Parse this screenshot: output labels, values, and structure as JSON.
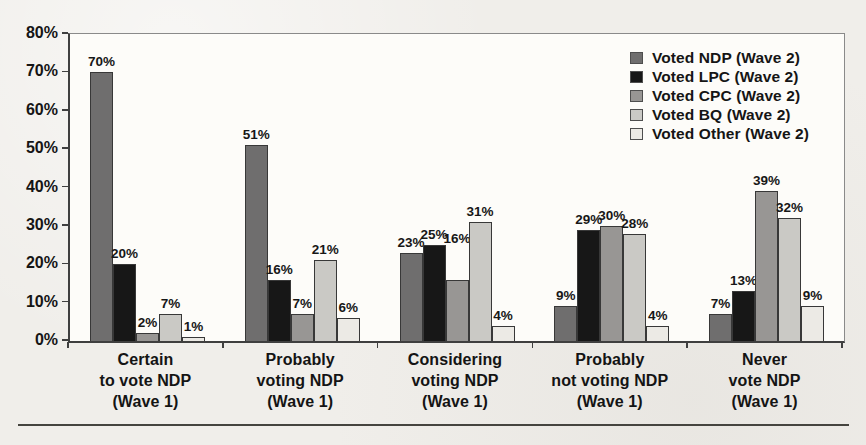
{
  "chart_data": {
    "type": "bar",
    "title": "",
    "categories": [
      "Certain\nto vote NDP\n(Wave 1)",
      "Probably\nvoting NDP\n(Wave 1)",
      "Considering\nvoting NDP\n(Wave 1)",
      "Probably\nnot voting NDP\n(Wave 1)",
      "Never\nvote NDP\n(Wave 1)"
    ],
    "series": [
      {
        "name": "Voted NDP (Wave 2)",
        "color": "#6f6e6e",
        "pattern": "solid",
        "values": [
          70,
          51,
          23,
          9,
          7
        ]
      },
      {
        "name": "Voted LPC (Wave 2)",
        "color": "#171717",
        "pattern": "solid",
        "values": [
          20,
          16,
          25,
          29,
          13
        ]
      },
      {
        "name": "Voted CPC (Wave 2)",
        "color": "#989694",
        "pattern": "fine-vertical",
        "values": [
          2,
          7,
          16,
          30,
          39
        ]
      },
      {
        "name": "Voted BQ (Wave 2)",
        "color": "#cac9c5",
        "pattern": "fine-grid",
        "values": [
          7,
          21,
          31,
          28,
          32
        ]
      },
      {
        "name": "Voted Other (Wave 2)",
        "color": "#eceae5",
        "pattern": "faint-grid",
        "values": [
          1,
          6,
          4,
          4,
          9
        ]
      }
    ],
    "value_label_suffix": "%",
    "ylim": [
      0,
      80
    ],
    "ytick_step": 10,
    "ytick_labels": [
      "0%",
      "10%",
      "20%",
      "30%",
      "40%",
      "50%",
      "60%",
      "70%",
      "80%"
    ],
    "grid": false,
    "legend_position": "top-right-inside",
    "label_raise_px": {
      "2,2": 31
    }
  }
}
